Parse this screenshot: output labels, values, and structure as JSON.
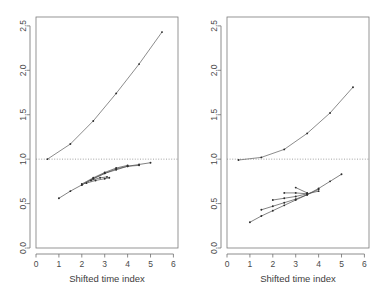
{
  "figure": {
    "title": "",
    "panel_count": 2,
    "background": "#ffffff",
    "line_color": "#4d4d4d",
    "refline_color": "#8a8a8a",
    "text_color": "#3d3d3d"
  },
  "axis": {
    "xlabel": "Shifted time index",
    "ylabel": "",
    "xticks": [
      "0",
      "1",
      "2",
      "3",
      "4",
      "5",
      "6"
    ],
    "yticks": [
      "0.0",
      "0.5",
      "1.0",
      "1.5",
      "2.0",
      "2.5"
    ],
    "xlim": [
      0,
      6.2
    ],
    "ylim": [
      0,
      2.6
    ],
    "grid": false,
    "reference_line_y": "1.0"
  },
  "chart_data": [
    {
      "type": "line",
      "panel": "left",
      "title": "",
      "xlabel": "Shifted time index",
      "ylabel": "",
      "xlim": [
        0,
        6.2
      ],
      "ylim": [
        0,
        2.6
      ],
      "grid": false,
      "legend": "none",
      "annotations": [
        {
          "kind": "hline",
          "y": 1.0,
          "style": "dotted"
        }
      ],
      "series": [
        {
          "name": "upper-curve",
          "group": "above-reference",
          "x": [
            0.5,
            1.5,
            2.5,
            3.5,
            4.5,
            5.5
          ],
          "values": [
            1.0,
            1.17,
            1.43,
            1.74,
            2.07,
            2.43
          ],
          "markers": true
        },
        {
          "name": "lower-curve-1",
          "group": "below-reference",
          "x": [
            1.0,
            1.5,
            2.0,
            2.5,
            3.0,
            3.5,
            4.0,
            4.5,
            5.0
          ],
          "values": [
            0.56,
            0.64,
            0.71,
            0.78,
            0.84,
            0.88,
            0.92,
            0.94,
            0.96
          ],
          "markers": true
        },
        {
          "name": "lower-curve-2",
          "group": "below-reference",
          "x": [
            2.0,
            2.5,
            3.0,
            3.5,
            4.0,
            4.5
          ],
          "values": [
            0.71,
            0.78,
            0.84,
            0.89,
            0.92,
            0.93
          ],
          "markers": true
        },
        {
          "name": "lower-curve-3",
          "group": "below-reference",
          "x": [
            2.0,
            2.5,
            3.0,
            3.5,
            4.0
          ],
          "values": [
            0.72,
            0.79,
            0.85,
            0.9,
            0.93
          ],
          "markers": true
        },
        {
          "name": "lower-curve-4",
          "group": "below-reference",
          "x": [
            2.2,
            2.6,
            3.0,
            3.2
          ],
          "values": [
            0.73,
            0.76,
            0.78,
            0.79
          ],
          "markers": true
        },
        {
          "name": "lower-curve-5",
          "group": "below-reference",
          "x": [
            2.4,
            2.8,
            3.1
          ],
          "values": [
            0.76,
            0.79,
            0.8
          ],
          "markers": true
        }
      ]
    },
    {
      "type": "line",
      "panel": "right",
      "title": "",
      "xlabel": "Shifted time index",
      "ylabel": "",
      "xlim": [
        0,
        6.2
      ],
      "ylim": [
        0,
        2.6
      ],
      "grid": false,
      "legend": "none",
      "annotations": [
        {
          "kind": "hline",
          "y": 1.0,
          "style": "dotted"
        }
      ],
      "series": [
        {
          "name": "upper-curve",
          "group": "above-reference",
          "x": [
            0.5,
            1.5,
            2.5,
            3.5,
            4.5,
            5.5
          ],
          "values": [
            0.99,
            1.02,
            1.11,
            1.29,
            1.52,
            1.81
          ],
          "markers": true
        },
        {
          "name": "lower-curve-1",
          "group": "below-reference",
          "x": [
            1.0,
            1.5,
            2.0,
            2.5,
            3.0,
            3.5,
            4.0,
            4.5,
            5.0
          ],
          "values": [
            0.29,
            0.36,
            0.42,
            0.48,
            0.54,
            0.6,
            0.67,
            0.75,
            0.83
          ],
          "markers": true
        },
        {
          "name": "lower-curve-2",
          "group": "below-reference",
          "x": [
            1.5,
            2.0,
            2.5,
            3.0,
            3.5,
            4.0
          ],
          "values": [
            0.43,
            0.47,
            0.51,
            0.55,
            0.6,
            0.66
          ],
          "markers": true
        },
        {
          "name": "lower-curve-3",
          "group": "below-reference",
          "x": [
            2.0,
            2.5,
            3.0,
            3.5,
            4.0
          ],
          "values": [
            0.54,
            0.56,
            0.58,
            0.61,
            0.64
          ],
          "markers": true
        },
        {
          "name": "lower-curve-4",
          "group": "below-reference",
          "x": [
            2.5,
            3.0,
            3.5
          ],
          "values": [
            0.62,
            0.62,
            0.61
          ],
          "markers": true
        },
        {
          "name": "lower-curve-5",
          "group": "below-reference",
          "x": [
            3.0,
            3.5
          ],
          "values": [
            0.68,
            0.62
          ],
          "markers": true
        }
      ]
    }
  ]
}
